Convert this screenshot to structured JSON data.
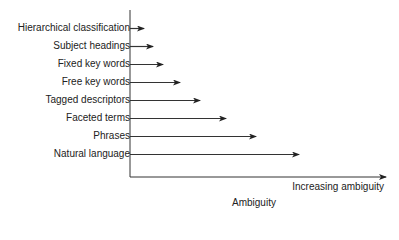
{
  "chart_data": {
    "type": "bar",
    "orientation": "horizontal",
    "title": "",
    "xlabel": "Ambiguity",
    "x_axis_annotation": "Increasing ambiguity",
    "ylabel": "",
    "categories": [
      "Hierarchical classification",
      "Subject headings",
      "Fixed key words",
      "Free key words",
      "Tagged descriptors",
      "Faceted terms",
      "Phrases",
      "Natural language"
    ],
    "values": [
      14,
      23,
      33,
      50,
      70,
      96,
      126,
      169
    ],
    "value_unit": "relative arrow length (px, qualitative)",
    "grid": false,
    "legend": null
  },
  "labels": {
    "rows": [
      "Hierarchical classification",
      "Subject headings",
      "Fixed key words",
      "Free key words",
      "Tagged descriptors",
      "Faceted terms",
      "Phrases",
      "Natural language"
    ],
    "x_annotation": "Increasing ambiguity",
    "x_title": "Ambiguity"
  }
}
